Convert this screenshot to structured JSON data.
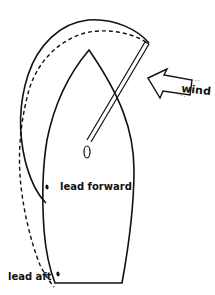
{
  "diagram": {
    "type": "sail-trim-illustration",
    "labels": {
      "wind": "wind",
      "lead_forward": "lead forward",
      "lead_aft": "lead aft"
    },
    "colors": {
      "stroke": "#111111",
      "background": "#ffffff"
    },
    "elements": [
      {
        "name": "hull-outline",
        "style": "solid"
      },
      {
        "name": "sail-lead-forward",
        "style": "solid"
      },
      {
        "name": "sail-lead-aft",
        "style": "dashed"
      },
      {
        "name": "spinnaker-pole",
        "style": "double-line"
      },
      {
        "name": "mast",
        "style": "ellipse"
      },
      {
        "name": "wind-arrow",
        "style": "outlined-arrow"
      },
      {
        "name": "lead-forward-point",
        "style": "dot"
      },
      {
        "name": "lead-aft-point",
        "style": "dot"
      }
    ]
  }
}
